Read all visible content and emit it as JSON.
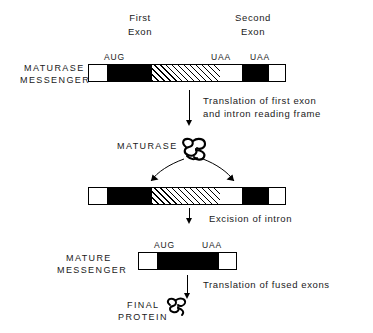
{
  "diagram": {
    "title_labels": {
      "first_exon": "First\nExon",
      "first_exon_line1": "First",
      "first_exon_line2": "Exon",
      "second_exon_line1": "Second",
      "second_exon_line2": "Exon"
    },
    "codons": {
      "start": "AUG",
      "stop": "UAA"
    },
    "rows": [
      {
        "id": "maturase-messenger",
        "label_line1": "MATURASE",
        "label_line2": "MESSENGER",
        "codon_labels": [
          {
            "text": "AUG",
            "x": 106
          },
          {
            "text": "UAA",
            "x": 213
          },
          {
            "text": "UAA",
            "x": 252
          }
        ],
        "segments": [
          {
            "name": "leader",
            "type": "open",
            "width": 18
          },
          {
            "name": "first-exon",
            "type": "exon",
            "width": 45
          },
          {
            "name": "intron",
            "type": "intron",
            "width": 68
          },
          {
            "name": "spacer",
            "type": "open",
            "width": 22
          },
          {
            "name": "second-exon",
            "type": "exon",
            "width": 27
          },
          {
            "name": "trailer",
            "type": "open",
            "width": 18
          }
        ]
      },
      {
        "id": "precursor-messenger",
        "label_line1": "",
        "label_line2": "",
        "codon_labels": [],
        "segments": [
          {
            "name": "leader",
            "type": "open",
            "width": 18
          },
          {
            "name": "first-exon",
            "type": "exon",
            "width": 45
          },
          {
            "name": "intron",
            "type": "intron",
            "width": 68
          },
          {
            "name": "spacer",
            "type": "open",
            "width": 22
          },
          {
            "name": "second-exon",
            "type": "exon",
            "width": 27
          },
          {
            "name": "trailer",
            "type": "open",
            "width": 18
          }
        ]
      },
      {
        "id": "mature-messenger",
        "label_line1": "MATURE",
        "label_line2": "MESSENGER",
        "codon_labels": [
          {
            "text": "AUG",
            "x": 156
          },
          {
            "text": "UAA",
            "x": 204
          }
        ],
        "segments": [
          {
            "name": "leader",
            "type": "open",
            "width": 18
          },
          {
            "name": "fused-exon",
            "type": "exon",
            "width": 62
          },
          {
            "name": "trailer",
            "type": "open",
            "width": 18
          }
        ]
      }
    ],
    "steps": [
      {
        "id": "translation-first-exon",
        "line1": "Translation of first exon",
        "line2": "and intron reading frame"
      },
      {
        "id": "excision-of-intron",
        "line1": "Excision of intron",
        "line2": ""
      },
      {
        "id": "translation-fused-exons",
        "line1": "Translation of fused exons",
        "line2": ""
      }
    ],
    "products": [
      {
        "id": "maturase-protein",
        "label": "MATURASE"
      },
      {
        "id": "final-protein",
        "label_line1": "FINAL",
        "label_line2": "PROTEIN"
      }
    ],
    "colors": {
      "ink": "#000000",
      "paper": "#ffffff"
    }
  }
}
